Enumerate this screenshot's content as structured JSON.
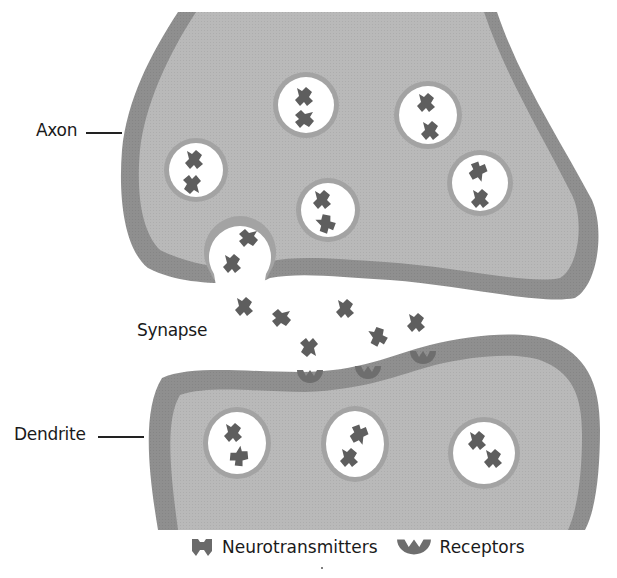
{
  "labels": {
    "axon": "Axon",
    "synapse": "Synapse",
    "dendrite": "Dendrite"
  },
  "legend": {
    "neurotransmitters": "Neurotransmitters",
    "receptors": "Receptors"
  },
  "colors": {
    "membrane": "#8e8e8e",
    "cytoplasm": "#b9b9b9",
    "vesicle_fill": "#ffffff",
    "vesicle_ring": "#a0a0a0",
    "molecule": "#5e5e5e",
    "receptor": "#6e6e6e",
    "text": "#1a1a1a"
  },
  "structures": {
    "axon_vesicles": 7,
    "fusing_vesicles": 1,
    "dendrite_vesicles": 3,
    "free_neurotransmitters_in_synapse": 7,
    "receptors": 3
  }
}
